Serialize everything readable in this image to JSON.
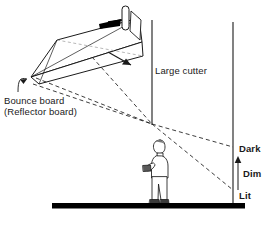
{
  "figure": {
    "domain": "diagram",
    "caption": "",
    "background_color": "#ffffff",
    "line_color": "#1a1a1a",
    "fill_color": "#000000",
    "width": 279,
    "height": 232
  },
  "labels": {
    "large_cutter": "Large cutter",
    "bounce_board_line1": "Bounce board",
    "bounce_board_line2": "(Reflector board)",
    "dark": "Dark",
    "dim": "Dim",
    "lit": "Lit"
  },
  "elements": {
    "light_source": "light-source-lamp",
    "light_direction_arrow": "light-beam-arrow",
    "reflected_beam_arrow": "reflected-beam-arrow",
    "bounce_board": "bounce-board-panel",
    "leader_line": "bounce-board-leader-line",
    "cutter": "large-cutter-flag",
    "person": "standing-camera-operator",
    "wall": "background-wall",
    "ground": "ground-floor-bar",
    "gradient_arrow": "light-falloff-arrow",
    "rays": "dashed-light-rays"
  }
}
